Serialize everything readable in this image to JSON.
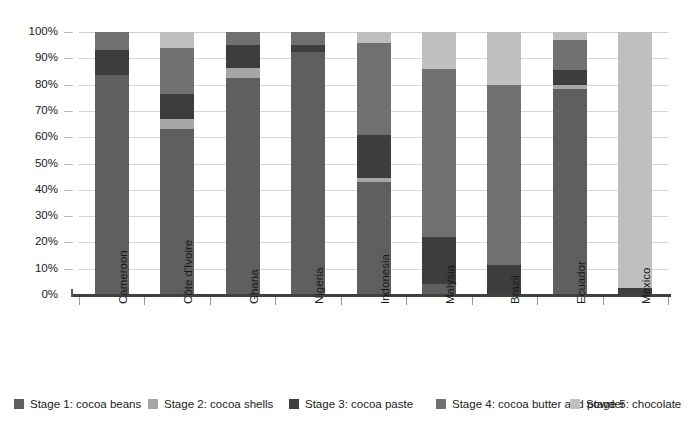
{
  "chart_data": {
    "type": "bar",
    "subtype": "stacked-100-percent",
    "title": "",
    "xlabel": "",
    "ylabel": "",
    "ylim": [
      0,
      100
    ],
    "ytick_labels": [
      "100%",
      "90%",
      "80%",
      "70%",
      "60%",
      "50%",
      "40%",
      "30%",
      "20%",
      "10%",
      "0%"
    ],
    "ytick_values": [
      100,
      90,
      80,
      70,
      60,
      50,
      40,
      30,
      20,
      10,
      0
    ],
    "grid": true,
    "legend_position": "bottom",
    "categories": [
      "Cameroon",
      "Côte d'Ivoire",
      "Ghana",
      "Nigeria",
      "Indonesia",
      "Malysia",
      "Brazil",
      "Ecuador",
      "Mexico"
    ],
    "series": [
      {
        "name": "Stage 1: cocoa beans",
        "color": "#5f5f5f",
        "values": [
          83.5,
          63.0,
          82.5,
          92.5,
          43.0,
          4.0,
          0.0,
          78.5,
          0.0
        ]
      },
      {
        "name": "Stage 2: cocoa shells",
        "color": "#a6a6a6",
        "values": [
          0.0,
          4.0,
          4.0,
          0.0,
          1.5,
          0.0,
          0.0,
          1.5,
          0.0
        ]
      },
      {
        "name": "Stage 3: cocoa paste",
        "color": "#3d3d3d",
        "values": [
          9.5,
          9.5,
          8.5,
          2.5,
          16.5,
          18.0,
          11.5,
          5.5,
          2.5
        ]
      },
      {
        "name": "Stage 4: cocoa butter and powder",
        "color": "#707070",
        "values": [
          7.0,
          17.5,
          5.0,
          5.0,
          35.0,
          64.0,
          68.5,
          11.5,
          0.0
        ]
      },
      {
        "name": "Stage 5: chocolate",
        "color": "#bfbfbf",
        "values": [
          0.0,
          6.0,
          0.0,
          0.0,
          4.0,
          14.0,
          20.0,
          3.0,
          97.5
        ]
      }
    ],
    "colors": {
      "stage1": "#5f5f5f",
      "stage2": "#a6a6a6",
      "stage3": "#3d3d3d",
      "stage4": "#707070",
      "stage5": "#bfbfbf",
      "gridline": "#d7d7d7",
      "axis": "#404040",
      "text": "#1a1a1a",
      "background": "#ffffff"
    }
  },
  "legend": {
    "items": [
      {
        "label": "Stage 1: cocoa beans",
        "color": "#5f5f5f"
      },
      {
        "label": "Stage 2: cocoa shells",
        "color": "#a6a6a6"
      },
      {
        "label": "Stage 3: cocoa paste",
        "color": "#3d3d3d"
      },
      {
        "label": "Stage 4: cocoa butter and powder",
        "color": "#707070"
      },
      {
        "label": "Stage 5: chocolate",
        "color": "#bfbfbf"
      }
    ]
  }
}
